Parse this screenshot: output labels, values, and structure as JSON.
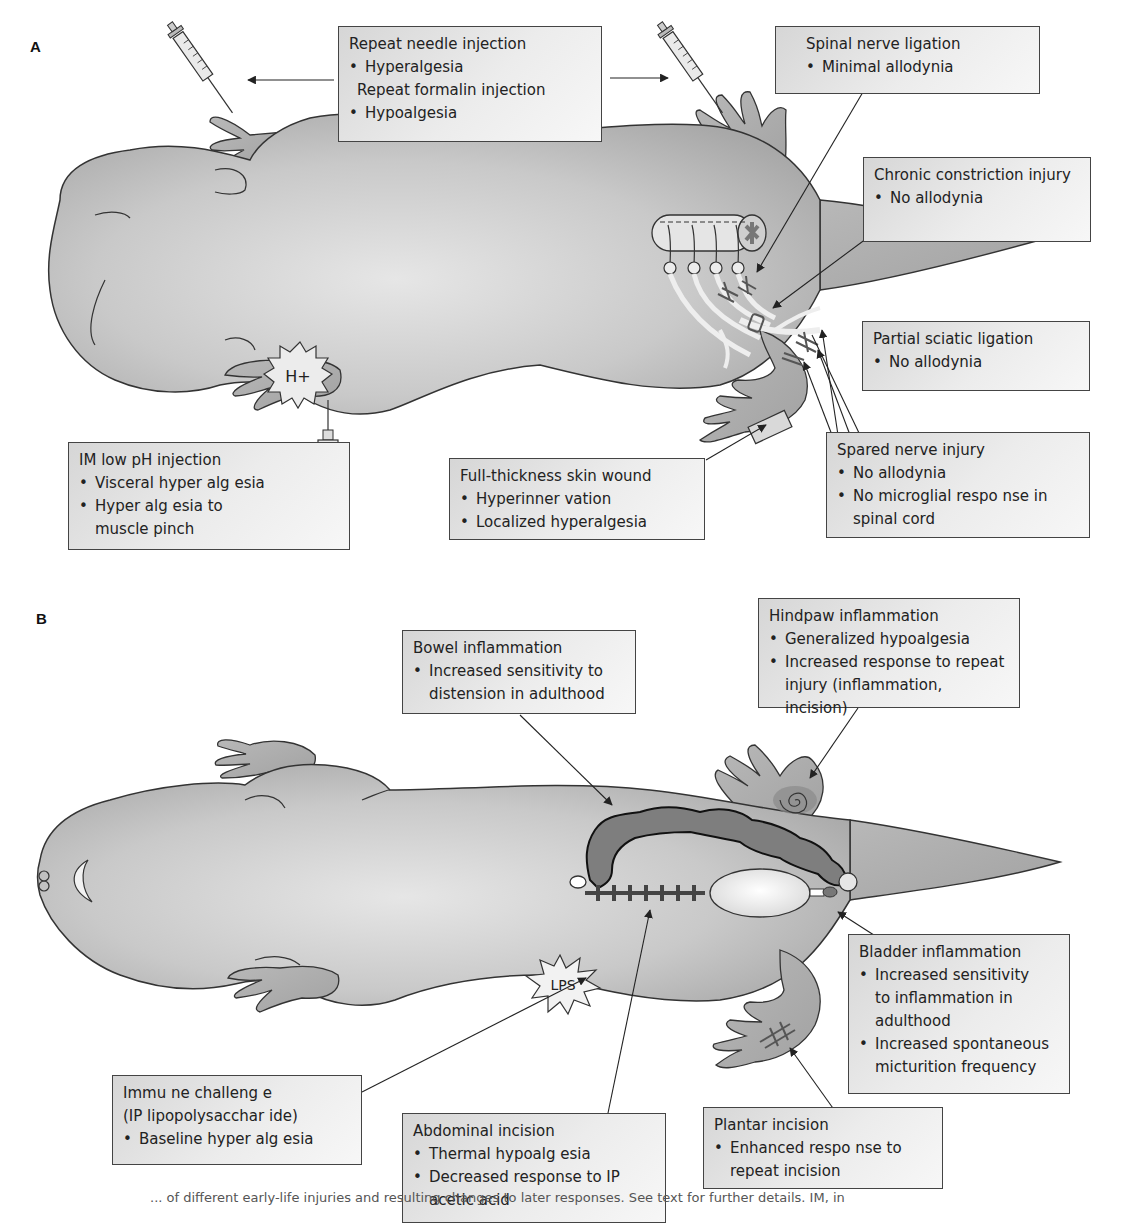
{
  "panels": {
    "a": {
      "label": "A",
      "boxes": {
        "repeat_injection": {
          "title": "Repeat needle injection",
          "bullet1": "Hyperalgesia",
          "subtitle": "Repeat formalin injection",
          "bullet2": "Hypoalgesia"
        },
        "spinal_nerve_ligation": {
          "title": "Spinal nerve ligation",
          "bullets": [
            "Minimal allodynia"
          ]
        },
        "chronic_constriction": {
          "title": "Chronic constriction injury",
          "bullets": [
            "No allodynia"
          ]
        },
        "partial_sciatic": {
          "title": "Partial sciatic ligation",
          "bullets": [
            "No allodynia"
          ]
        },
        "spared_nerve": {
          "title": "Spared nerve injury",
          "bullets": [
            "No allodynia",
            "No microglial respo nse in spinal cord"
          ]
        },
        "im_low_ph": {
          "title": "IM low pH injection",
          "bullets": [
            "Visceral hyper  alg esia",
            "Hyper alg esia to muscle pinch"
          ]
        },
        "skin_wound": {
          "title": "Full-thickness skin wound",
          "bullets": [
            "Hyperinner vation",
            "Localized hyperalgesia"
          ]
        }
      },
      "markers": {
        "proton": "H+"
      }
    },
    "b": {
      "label": "B",
      "boxes": {
        "bowel": {
          "title": "Bowel inflammation",
          "bullets": [
            "Increased sensitivity to distension in adulthood"
          ]
        },
        "hindpaw": {
          "title": "Hindpaw inflammation",
          "bullets": [
            "Generalized hypoalgesia",
            "Increased response to repeat injury (inflammation, incision)"
          ]
        },
        "bladder": {
          "title": "Bladder inflammation",
          "bullets": [
            "Increased sensitivity to inflammation in adulthood",
            "Increased spontaneous micturition frequency"
          ]
        },
        "immune": {
          "title": "Immu ne challeng  e",
          "subtitle": "(IP lipopolysacchar  ide)",
          "bullets": [
            "Baseline hyper  alg esia"
          ]
        },
        "abdominal": {
          "title": "Abdominal incision",
          "bullets": [
            "Thermal hypoalg  esia",
            "Decreased  response to IP acetic acid"
          ]
        },
        "plantar": {
          "title": "Plantar incision",
          "bullets": [
            "Enhanced respo nse to repeat incision"
          ]
        }
      },
      "markers": {
        "lps": "LPS"
      }
    }
  },
  "caption": "... of different early-life injuries and resulting changes to later responses. See text for further details. IM, in"
}
